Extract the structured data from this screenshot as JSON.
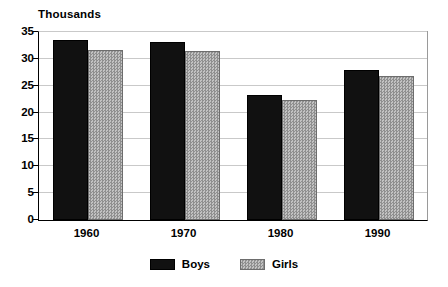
{
  "chart_data": {
    "type": "bar",
    "title": "Thousands",
    "xlabel": "",
    "ylabel": "",
    "categories": [
      "1960",
      "1970",
      "1980",
      "1990"
    ],
    "series": [
      {
        "name": "Boys",
        "color": "#111111",
        "values": [
          33.5,
          33.2,
          23.2,
          28.0
        ]
      },
      {
        "name": "Girls",
        "color": "#a8a8a8",
        "values": [
          31.6,
          31.5,
          22.4,
          26.9
        ]
      }
    ],
    "ylim": [
      0,
      35
    ],
    "yticks": [
      0,
      5,
      10,
      15,
      20,
      25,
      30,
      35
    ],
    "ytick_labels": [
      "0",
      "5",
      "10",
      "15",
      "20",
      "25",
      "30",
      "35"
    ],
    "grid": true,
    "grid_axis": "y",
    "legend_position": "bottom-center"
  }
}
